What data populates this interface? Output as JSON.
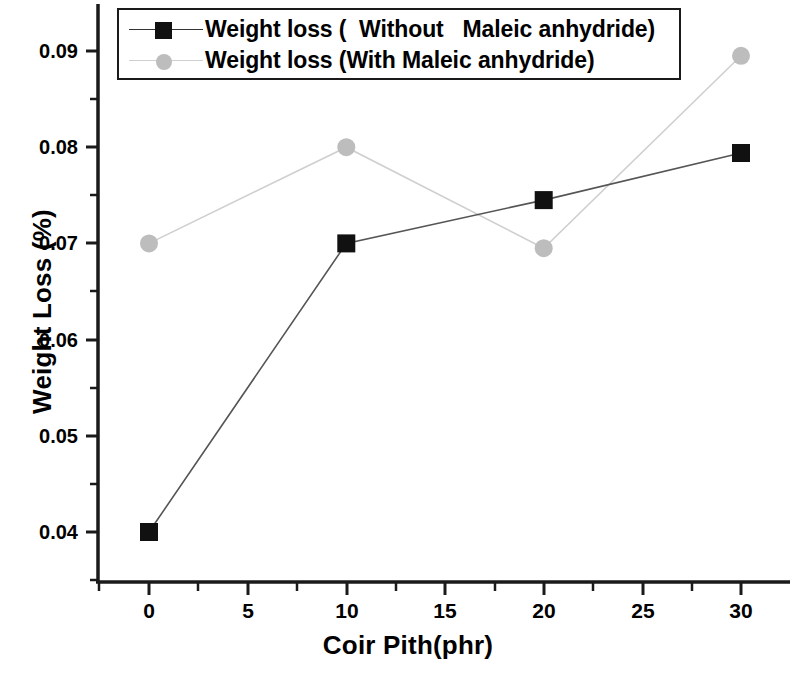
{
  "chart_data": {
    "type": "line",
    "title": "",
    "xlabel": "Coir Pith(phr)",
    "ylabel": "Weight Loss (%)",
    "xlim": [
      -2.6,
      32.5
    ],
    "ylim": [
      0.0365,
      0.0925
    ],
    "xticks": [
      0,
      5,
      10,
      15,
      20,
      25,
      30
    ],
    "xtick_labels": [
      "0",
      "5",
      "10",
      "15",
      "20",
      "25",
      "30"
    ],
    "yticks": [
      0.04,
      0.05,
      0.06,
      0.07,
      0.08,
      0.09
    ],
    "ytick_labels": [
      "0.04",
      "0.05",
      "0.06",
      "0.07",
      "0.08",
      "0.09"
    ],
    "minor_ytick_interval": 0.005,
    "minor_xtick_interval": 2.5,
    "grid": false,
    "legend_position": "top-center",
    "x": [
      0,
      10,
      20,
      30
    ],
    "series": [
      {
        "name": "Weight loss (  Without   Maleic anhydride)",
        "marker": "square",
        "marker_color": "#111111",
        "line_color": "#555555",
        "values": [
          0.04,
          0.07,
          0.0745,
          0.0794
        ]
      },
      {
        "name": "Weight loss (With Maleic anhydride)",
        "marker": "circle",
        "marker_color": "#bdbdbd",
        "line_color": "#cfcfcf",
        "values": [
          0.07,
          0.08,
          0.0695,
          0.0895
        ]
      }
    ]
  },
  "legend": {
    "entries": [
      {
        "label": "Weight loss (  Without   Maleic anhydride)"
      },
      {
        "label": "Weight loss (With Maleic anhydride)"
      }
    ]
  },
  "axes": {
    "x_title": "Coir Pith(phr)",
    "y_title": "Weight Loss (%)",
    "x_tick_labels": [
      "0",
      "5",
      "10",
      "15",
      "20",
      "25",
      "30"
    ],
    "y_tick_labels": [
      "0.04",
      "0.05",
      "0.06",
      "0.07",
      "0.08",
      "0.09"
    ]
  },
  "colors": {
    "axis": "#1a1a1a",
    "series_without": "#111111",
    "series_with": "#bdbdbd",
    "background": "#ffffff"
  }
}
